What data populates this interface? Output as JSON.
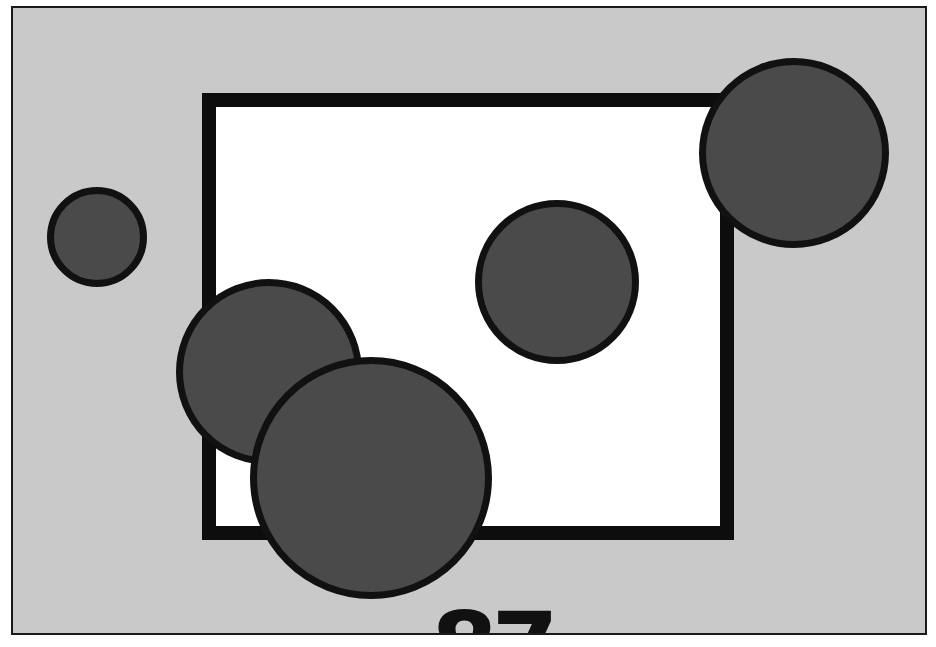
{
  "figure": {
    "background_color": "#c9c9c9",
    "frame_border_color": "#1a1a1a",
    "rectangle": {
      "left": 202,
      "top": 93,
      "right": 734,
      "bottom": 540,
      "fill": "#ffffff",
      "border_color": "#0d0d0d",
      "border_width": 14
    },
    "circles": [
      {
        "name": "small-left",
        "cx": 97,
        "cy": 237,
        "r": 50
      },
      {
        "name": "middle",
        "cx": 557,
        "cy": 280,
        "r": 82
      },
      {
        "name": "top-right",
        "cx": 794,
        "cy": 151,
        "r": 95
      },
      {
        "name": "left-mid",
        "cx": 269,
        "cy": 370,
        "r": 93
      },
      {
        "name": "big-bottom",
        "cx": 371,
        "cy": 476,
        "r": 121
      }
    ],
    "circle_fill": "#4a4a4a",
    "circle_border_color": "#111111",
    "page_label": "87"
  }
}
